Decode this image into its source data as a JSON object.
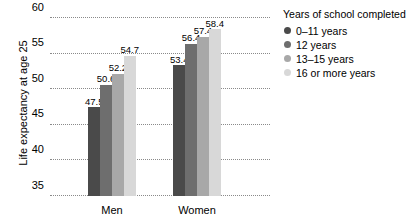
{
  "chart_data": {
    "type": "bar",
    "title": "",
    "xlabel": "",
    "ylabel": "Life expectancy at age 25",
    "ylim": [
      35,
      60
    ],
    "yticks": [
      35,
      40,
      45,
      50,
      55,
      60
    ],
    "grid": true,
    "categories": [
      "Men",
      "Women"
    ],
    "legend_title": "Years of school completed",
    "legend_position": "right",
    "series": [
      {
        "name": "0–11 years",
        "color": "#4a4a4a",
        "values": [
          47.5,
          53.4
        ]
      },
      {
        "name": "12 years",
        "color": "#6e6e6e",
        "values": [
          50.6,
          56.4
        ]
      },
      {
        "name": "13–15 years",
        "color": "#a8a8a8",
        "values": [
          52.2,
          57.4
        ]
      },
      {
        "name": "16 or more years",
        "color": "#d8d8d8",
        "values": [
          54.7,
          58.4
        ]
      }
    ],
    "value_labels": {
      "Men": [
        "47.5",
        "50.6",
        "52.2",
        "54.7"
      ],
      "Women": [
        "53.4",
        "56.4",
        "57.4",
        "58.4"
      ]
    },
    "ytick_labels": [
      "35",
      "40",
      "45",
      "50",
      "55",
      "60"
    ]
  }
}
